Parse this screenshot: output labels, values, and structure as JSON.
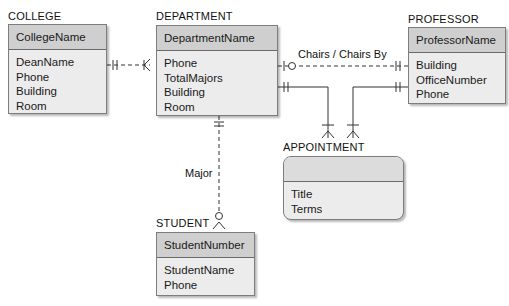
{
  "entities": {
    "college": {
      "title": "COLLEGE",
      "key": "CollegeName",
      "attributes": [
        "DeanName",
        "Phone",
        "Building",
        "Room"
      ]
    },
    "department": {
      "title": "DEPARTMENT",
      "key": "DepartmentName",
      "attributes": [
        "Phone",
        "TotalMajors",
        "Building",
        "Room"
      ]
    },
    "professor": {
      "title": "PROFESSOR",
      "key": "ProfessorName",
      "attributes": [
        "Building",
        "OfficeNumber",
        "Phone"
      ]
    },
    "appointment": {
      "title": "APPOINTMENT",
      "key": "",
      "attributes": [
        "Title",
        "Terms"
      ]
    },
    "student": {
      "title": "STUDENT",
      "key": "StudentNumber",
      "attributes": [
        "StudentName",
        "Phone"
      ]
    }
  },
  "relationships": {
    "chairs": "Chairs / Chairs By",
    "major": "Major"
  }
}
